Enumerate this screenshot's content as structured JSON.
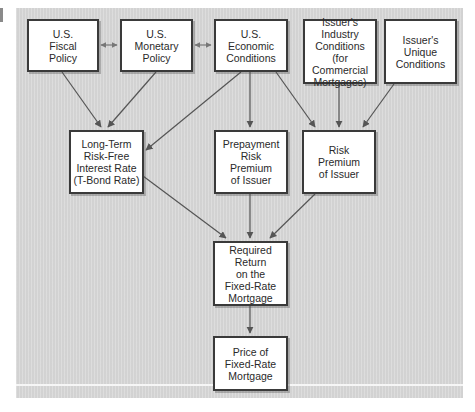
{
  "diagram": {
    "colors": {
      "background": "#d9d9d9",
      "box_fill": "#ffffff",
      "box_border": "#3a3a3a",
      "arrow": "#555555",
      "text": "#2a2a2a"
    },
    "nodes": {
      "fiscal": {
        "label": "U.S.\nFiscal\nPolicy"
      },
      "monetary": {
        "label": "U.S.\nMonetary\nPolicy"
      },
      "economic": {
        "label": "U.S.\nEconomic\nConditions"
      },
      "industry": {
        "label": "Issuer's\nIndustry\nConditions (for\nCommercial\nMortgages)"
      },
      "unique": {
        "label": "Issuer's\nUnique\nConditions"
      },
      "risk_free": {
        "label": "Long-Term\nRisk-Free\nInterest Rate\n(T-Bond Rate)"
      },
      "prepayment": {
        "label": "Prepayment\nRisk\nPremium\nof Issuer"
      },
      "risk_premium": {
        "label": "Risk\nPremium\nof Issuer"
      },
      "required_return": {
        "label": "Required Return\non the\nFixed-Rate\nMortgage"
      },
      "price": {
        "label": "Price of\nFixed-Rate\nMortgage"
      }
    },
    "edges": [
      {
        "from": "fiscal",
        "to": "monetary",
        "type": "bidirectional"
      },
      {
        "from": "monetary",
        "to": "economic",
        "type": "bidirectional"
      },
      {
        "from": "fiscal",
        "to": "risk_free",
        "type": "arrow"
      },
      {
        "from": "monetary",
        "to": "risk_free",
        "type": "arrow"
      },
      {
        "from": "economic",
        "to": "risk_free",
        "type": "arrow"
      },
      {
        "from": "economic",
        "to": "prepayment",
        "type": "arrow"
      },
      {
        "from": "economic",
        "to": "risk_premium",
        "type": "arrow"
      },
      {
        "from": "industry",
        "to": "risk_premium",
        "type": "arrow"
      },
      {
        "from": "unique",
        "to": "risk_premium",
        "type": "arrow"
      },
      {
        "from": "risk_free",
        "to": "required_return",
        "type": "arrow"
      },
      {
        "from": "prepayment",
        "to": "required_return",
        "type": "arrow"
      },
      {
        "from": "risk_premium",
        "to": "required_return",
        "type": "arrow"
      },
      {
        "from": "required_return",
        "to": "price",
        "type": "arrow"
      }
    ]
  }
}
